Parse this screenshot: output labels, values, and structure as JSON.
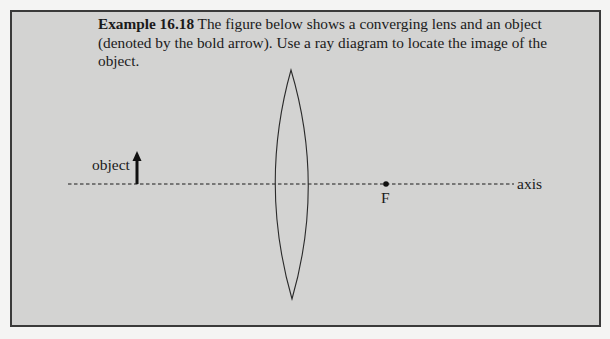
{
  "example": {
    "label": "Example 16.18",
    "text": " The figure below shows a converging lens and an object (denoted by the bold arrow). Use a ray diagram to locate the image of the object."
  },
  "diagram": {
    "object_label": "object",
    "focal_point_label": "F",
    "axis_label": "axis",
    "elements": {
      "axis": {
        "x_start": 68,
        "x_end": 514,
        "y": 184,
        "style": "dashed"
      },
      "object_arrow": {
        "x": 137,
        "y_base": 184,
        "y_tip": 152
      },
      "lens": {
        "type": "converging",
        "center_x": 292,
        "top_y": 70,
        "bottom_y": 299,
        "half_width": 16
      },
      "focal_point": {
        "x": 386,
        "y": 184
      }
    },
    "colors": {
      "panel_background": "#d3d3d2",
      "page_background": "#f4f4f3",
      "ink": "#1a1a1a",
      "border": "#3a3a3a"
    }
  }
}
